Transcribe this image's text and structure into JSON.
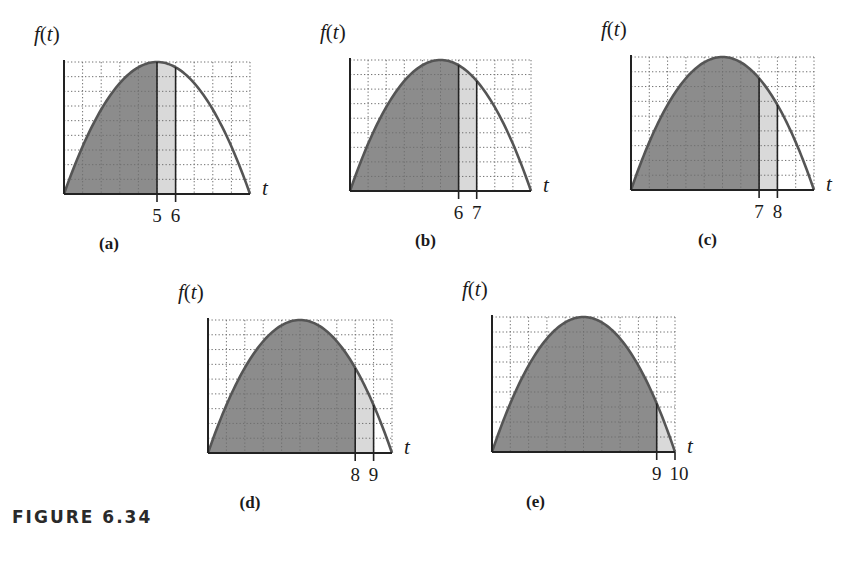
{
  "figure_caption": "FIGURE 6.34",
  "axis": {
    "y_label_fn": "f",
    "y_label_var": "t",
    "x_label": "t"
  },
  "colors": {
    "dark_fill": "#8c8c8c",
    "light_fill": "#d9d9d9",
    "curve": "#555555",
    "axis": "#222222",
    "grid": "#6f6f6f"
  },
  "panels": [
    {
      "id": "a",
      "sublabel": "(a)",
      "a": 5,
      "b": 6,
      "tick_a": "5",
      "tick_b": "6",
      "x0": 64,
      "top": 62,
      "base": 194,
      "right": 250
    },
    {
      "id": "b",
      "sublabel": "(b)",
      "a": 6,
      "b": 7,
      "tick_a": "6",
      "tick_b": "7",
      "x0": 350,
      "top": 60,
      "base": 191,
      "right": 531
    },
    {
      "id": "c",
      "sublabel": "(c)",
      "a": 7,
      "b": 8,
      "tick_a": "7",
      "tick_b": "8",
      "x0": 631,
      "top": 57,
      "base": 190,
      "right": 814
    },
    {
      "id": "d",
      "sublabel": "(d)",
      "a": 8,
      "b": 9,
      "tick_a": "8",
      "tick_b": "9",
      "x0": 208,
      "top": 320,
      "base": 453,
      "right": 392
    },
    {
      "id": "e",
      "sublabel": "(e)",
      "a": 9,
      "b": 10,
      "tick_a": "9",
      "tick_b": "10",
      "x0": 492,
      "top": 317,
      "base": 452,
      "right": 675
    }
  ],
  "chart_data": [
    {
      "type": "area",
      "title": "(a)",
      "function": "f(t) concave-down parabola, zeros at t=0 and t=10, max at t=5",
      "xlabel": "t",
      "ylabel": "f(t)",
      "xlim": [
        0,
        10
      ],
      "grid": true,
      "shaded_dark": [
        0,
        5
      ],
      "shaded_light": [
        5,
        6
      ],
      "ticks": [
        5,
        6
      ]
    },
    {
      "type": "area",
      "title": "(b)",
      "function": "f(t) concave-down parabola, zeros at t=0 and t=10, max at t=5",
      "xlabel": "t",
      "ylabel": "f(t)",
      "xlim": [
        0,
        10
      ],
      "grid": true,
      "shaded_dark": [
        0,
        6
      ],
      "shaded_light": [
        6,
        7
      ],
      "ticks": [
        6,
        7
      ]
    },
    {
      "type": "area",
      "title": "(c)",
      "function": "f(t) concave-down parabola, zeros at t=0 and t=10, max at t=5",
      "xlabel": "t",
      "ylabel": "f(t)",
      "xlim": [
        0,
        10
      ],
      "grid": true,
      "shaded_dark": [
        0,
        7
      ],
      "shaded_light": [
        7,
        8
      ],
      "ticks": [
        7,
        8
      ]
    },
    {
      "type": "area",
      "title": "(d)",
      "function": "f(t) concave-down parabola, zeros at t=0 and t=10, max at t=5",
      "xlabel": "t",
      "ylabel": "f(t)",
      "xlim": [
        0,
        10
      ],
      "grid": true,
      "shaded_dark": [
        0,
        8
      ],
      "shaded_light": [
        8,
        9
      ],
      "ticks": [
        8,
        9
      ]
    },
    {
      "type": "area",
      "title": "(e)",
      "function": "f(t) concave-down parabola, zeros at t=0 and t=10, max at t=5",
      "xlabel": "t",
      "ylabel": "f(t)",
      "xlim": [
        0,
        10
      ],
      "grid": true,
      "shaded_dark": [
        0,
        9
      ],
      "shaded_light": [
        9,
        10
      ],
      "ticks": [
        9,
        10
      ]
    }
  ]
}
